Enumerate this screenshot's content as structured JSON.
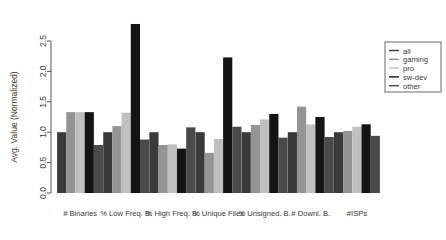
{
  "chart_data": {
    "type": "bar",
    "title": "",
    "xlabel": "",
    "ylabel": "Avg. Value (Normalized)",
    "ylim": [
      0,
      2.9
    ],
    "yticks": [
      0.0,
      0.5,
      1.0,
      1.5,
      2.0,
      2.5
    ],
    "ytick_labels": [
      "0.0",
      "0.5",
      "1.0",
      "1.5",
      "2.0",
      "2.5"
    ],
    "grid": false,
    "legend_position": "right",
    "categories": [
      "# Binaries",
      "% Low Freq. B.",
      "% High Freq. B.",
      "% Unique Files",
      "% Unsigned. B.",
      "# Downl. B.",
      "#ISPs"
    ],
    "series": [
      {
        "name": "all",
        "color": "#3a3a3a",
        "values": [
          1.0,
          1.0,
          1.0,
          1.0,
          1.0,
          1.0,
          1.0
        ]
      },
      {
        "name": "gaming",
        "color": "#949494",
        "values": [
          1.33,
          1.1,
          0.79,
          0.66,
          1.12,
          1.42,
          1.02
        ]
      },
      {
        "name": "pro",
        "color": "#c0c0c0",
        "values": [
          1.33,
          1.32,
          0.8,
          0.89,
          1.21,
          1.13,
          1.09
        ]
      },
      {
        "name": "sw-dev",
        "color": "#141414",
        "values": [
          1.33,
          2.78,
          0.73,
          2.23,
          1.3,
          1.25,
          1.13
        ]
      },
      {
        "name": "other",
        "color": "#4a4a4a",
        "values": [
          0.79,
          0.88,
          1.08,
          1.09,
          0.91,
          0.92,
          0.94
        ]
      }
    ],
    "legend_entries": [
      "all",
      "gaming",
      "pro",
      "sw-dev",
      "other"
    ]
  }
}
